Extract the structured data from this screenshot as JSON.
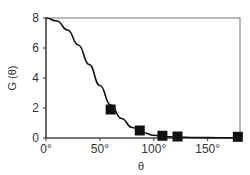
{
  "chart_data": {
    "type": "line",
    "title": "",
    "xlabel": "θ",
    "ylabel": "G (θ)",
    "xlim": [
      0,
      180
    ],
    "ylim": [
      0,
      8
    ],
    "xticks": [
      0,
      50,
      100,
      150
    ],
    "xtick_labels": [
      "0°",
      "50°",
      "100°",
      "150°"
    ],
    "yticks": [
      0,
      2,
      4,
      6,
      8
    ],
    "ytick_labels": [
      "0",
      "2",
      "4",
      "6",
      "8"
    ],
    "grid": false,
    "legend": null,
    "series": [
      {
        "name": "fit curve",
        "style": "line",
        "x": [
          0,
          10,
          20,
          30,
          40,
          50,
          60,
          70,
          80,
          90,
          100,
          110,
          120,
          140,
          160,
          180
        ],
        "y": [
          8.0,
          7.8,
          7.2,
          6.2,
          4.9,
          3.5,
          2.2,
          1.3,
          0.7,
          0.35,
          0.18,
          0.1,
          0.06,
          0.03,
          0.02,
          0.02
        ]
      },
      {
        "name": "measured",
        "style": "square-markers",
        "x": [
          60,
          87,
          108,
          122,
          178
        ],
        "y": [
          1.9,
          0.5,
          0.15,
          0.1,
          0.08
        ]
      }
    ]
  }
}
